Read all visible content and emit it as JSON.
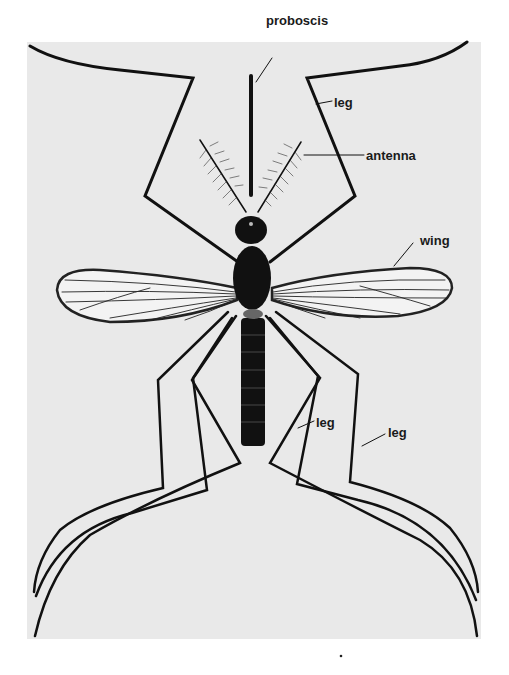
{
  "figure": {
    "colors": {
      "background": "#ffffff",
      "panel": "#e9e9e9",
      "ink": "#111111"
    },
    "labels": [
      {
        "id": "proboscis",
        "text": "proboscis",
        "x": 266,
        "y": 44
      },
      {
        "id": "leg-front-right",
        "text": "leg",
        "x": 334,
        "y": 96
      },
      {
        "id": "antenna",
        "text": "antenna",
        "x": 366,
        "y": 150
      },
      {
        "id": "wing",
        "text": "wing",
        "x": 420,
        "y": 238
      },
      {
        "id": "leg-mid-right",
        "text": "leg",
        "x": 316,
        "y": 417
      },
      {
        "id": "leg-hind-right",
        "text": "leg",
        "x": 388,
        "y": 427
      }
    ]
  }
}
